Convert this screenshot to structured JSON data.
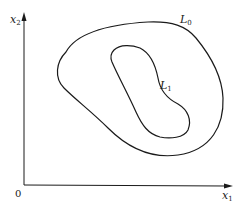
{
  "diagram": {
    "type": "level-curves",
    "axes": {
      "x_label": "x",
      "x_label_sub": "1",
      "y_label": "x",
      "y_label_sub": "2",
      "origin_label": "0"
    },
    "curves": [
      {
        "name": "L",
        "sub": "0",
        "role": "outer closed curve"
      },
      {
        "name": "L",
        "sub": "1",
        "role": "inner closed curve"
      }
    ],
    "colors": {
      "stroke": "#1a1a1a",
      "background": "#ffffff"
    }
  }
}
